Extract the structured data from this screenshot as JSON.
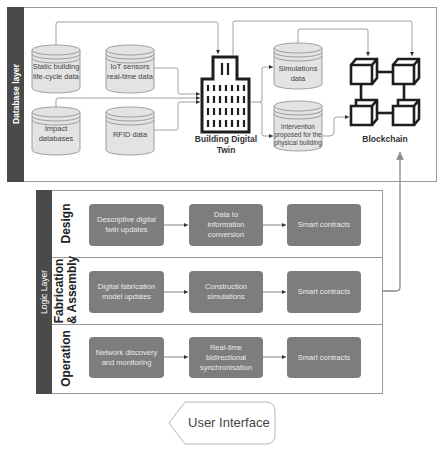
{
  "database_layer": {
    "label": "Database layer",
    "sources": [
      {
        "id": "static",
        "lines": [
          "Static building",
          "life-cycle data"
        ]
      },
      {
        "id": "iot",
        "lines": [
          "IoT sensors",
          "real-time data"
        ]
      },
      {
        "id": "impact",
        "lines": [
          "Impact",
          "databases"
        ]
      },
      {
        "id": "rfid",
        "lines": [
          "RFID data"
        ]
      }
    ],
    "digital_twin": {
      "lines": [
        "Building Digital",
        "Twin"
      ],
      "icon": "building-icon"
    },
    "outputs": [
      {
        "id": "simulations",
        "lines": [
          "Simulations",
          "data"
        ]
      },
      {
        "id": "intervention",
        "lines": [
          "Intervention",
          "proposed for the",
          "physical building"
        ]
      }
    ],
    "blockchain": {
      "label": "Blockchain",
      "icon": "blockchain-icon"
    }
  },
  "logic_layer": {
    "label": "Logic Layer",
    "rows": [
      {
        "label_lines": [
          "Design"
        ],
        "steps": [
          [
            "Descriptive digital",
            "twin updates"
          ],
          [
            "Data to",
            "information",
            "conversion"
          ],
          [
            "Smart contracts"
          ]
        ]
      },
      {
        "label_lines": [
          "Fabrication",
          "& Assembly"
        ],
        "steps": [
          [
            "Digital fabrication",
            "model updates"
          ],
          [
            "Construction",
            "simulations"
          ],
          [
            "Smart contracts"
          ]
        ]
      },
      {
        "label_lines": [
          "Operation"
        ],
        "steps": [
          [
            "Network discovery",
            "and monitoring"
          ],
          [
            "Real-time",
            "bidirectional",
            "synchronisation"
          ],
          [
            "Smart contracts"
          ]
        ]
      }
    ]
  },
  "user_interface": {
    "label": "User Interface"
  },
  "colors": {
    "layer_bar": "#4a4a4a",
    "process_box": "#7d7d7d",
    "cylinder_fill": "#e3e3e3",
    "connector": "#8c8c8c",
    "icon_stroke": "#1e1e1e"
  }
}
